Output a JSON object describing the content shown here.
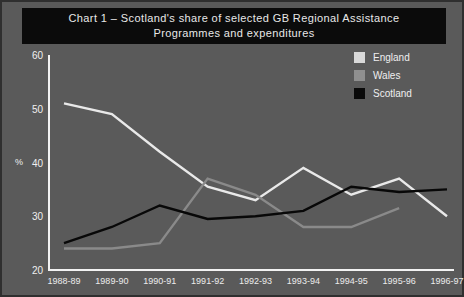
{
  "title": {
    "line1": "Chart 1 – Scotland's share of selected GB Regional Assistance",
    "line2": "Programmes and expenditures"
  },
  "colors": {
    "background": "#5a5a5a",
    "banner": "#0b0b0b",
    "axis": "#f2f2f2",
    "england": "#e9e9e9",
    "wales": "#8a8a8a",
    "scotland": "#080808",
    "border": "#2f2f2f"
  },
  "legend": {
    "position": "top-right",
    "items": [
      {
        "label": "England",
        "color": "#d9d9d9",
        "swatch": "england-swatch"
      },
      {
        "label": "Wales",
        "color": "#8f8f8f",
        "swatch": "wales-swatch"
      },
      {
        "label": "Scotland",
        "color": "#0a0a0a",
        "swatch": "scotland-swatch"
      }
    ]
  },
  "axes": {
    "ylabel": "%",
    "yticks": [
      "20",
      "30",
      "40",
      "50",
      "60"
    ],
    "xticks": [
      "1988-89",
      "1989-90",
      "1990-91",
      "1991-92",
      "1992-93",
      "1993-94",
      "1994-95",
      "1995-96",
      "1996-97"
    ]
  },
  "chart_data": {
    "type": "line",
    "title": "Chart 1 – Scotland's share of selected GB Regional Assistance Programmes and expenditures",
    "xlabel": "",
    "ylabel": "%",
    "ylim": [
      20,
      60
    ],
    "yticks": [
      20,
      30,
      40,
      50,
      60
    ],
    "grid": false,
    "legend_position": "top-right",
    "categories": [
      "1988-89",
      "1989-90",
      "1990-91",
      "1991-92",
      "1992-93",
      "1993-94",
      "1994-95",
      "1995-96",
      "1996-97"
    ],
    "series": [
      {
        "name": "England",
        "color": "#e9e9e9",
        "values": [
          51,
          49,
          42,
          35.5,
          33,
          39,
          34,
          37,
          30
        ]
      },
      {
        "name": "Wales",
        "color": "#8a8a8a",
        "values": [
          24,
          24,
          25,
          37,
          34,
          28,
          28,
          31.5,
          null
        ]
      },
      {
        "name": "Scotland",
        "color": "#080808",
        "values": [
          25,
          28,
          32,
          29.5,
          30,
          31,
          35.5,
          34.5,
          35
        ]
      }
    ]
  }
}
